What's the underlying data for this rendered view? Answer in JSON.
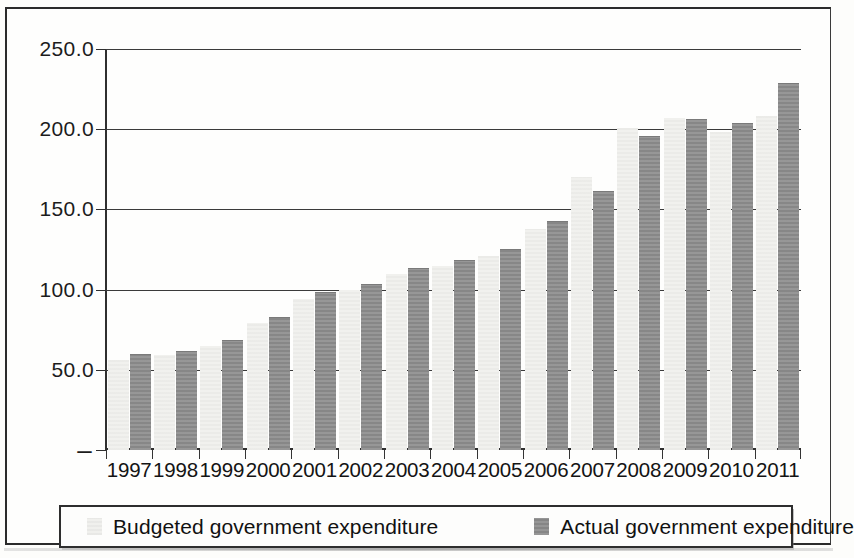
{
  "chart_data": {
    "type": "bar",
    "title": "",
    "subtitle": "",
    "xlabel": "",
    "ylabel": "",
    "ylim": [
      0,
      250
    ],
    "y_ticks": [
      "250.0",
      "200.0",
      "150.0",
      "100.0",
      "50.0",
      "–"
    ],
    "y_tick_values": [
      250,
      200,
      150,
      100,
      50,
      0
    ],
    "grid": true,
    "legend_position": "bottom",
    "categories": [
      "1997",
      "1998",
      "1999",
      "2000",
      "2001",
      "2002",
      "2003",
      "2004",
      "2005",
      "2006",
      "2007",
      "2008",
      "2009",
      "2010",
      "2011"
    ],
    "series": [
      {
        "name": "Budgeted government expenditure",
        "color": "#f0f0ed",
        "values": [
          56,
          59,
          65,
          79,
          94,
          100,
          110,
          115,
          121,
          138,
          170,
          201,
          207,
          198,
          208
        ]
      },
      {
        "name": "Actual government expenditure",
        "color": "#8a8a8a",
        "values": [
          59,
          61,
          68,
          82,
          98,
          103,
          113,
          118,
          125,
          142,
          161,
          195,
          206,
          203,
          228
        ]
      }
    ]
  },
  "legend": {
    "items": [
      {
        "label": "Budgeted government expenditure",
        "swatch": "light-gray-square-icon"
      },
      {
        "label": "Actual government expenditure",
        "swatch": "dark-gray-square-icon"
      }
    ]
  }
}
